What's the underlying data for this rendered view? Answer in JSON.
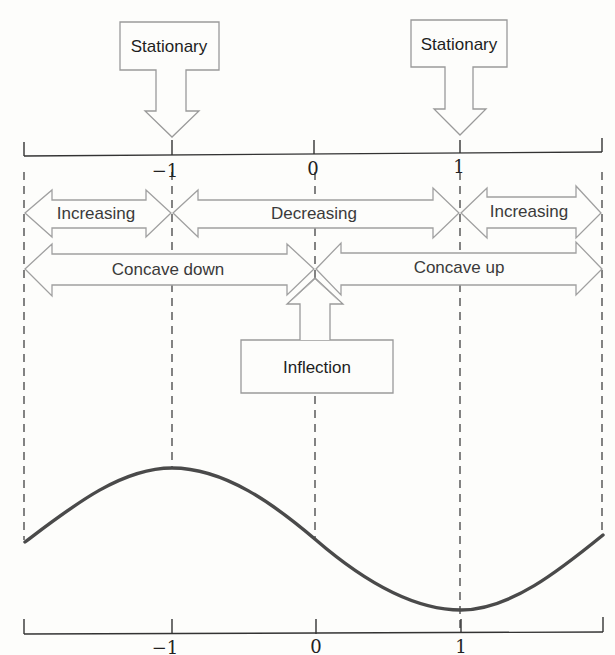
{
  "diagram": {
    "callouts": {
      "stationary_left": "Stationary",
      "stationary_right": "Stationary",
      "inflection": "Inflection"
    },
    "intervals_monotonic": [
      {
        "label": "Increasing",
        "from": "left-edge",
        "to": "-1"
      },
      {
        "label": "Decreasing",
        "from": "-1",
        "to": "1"
      },
      {
        "label": "Increasing",
        "from": "1",
        "to": "right-edge"
      }
    ],
    "intervals_concavity": [
      {
        "label": "Concave down",
        "from": "left-edge",
        "to": "0"
      },
      {
        "label": "Concave up",
        "from": "0",
        "to": "right-edge"
      }
    ],
    "top_axis": {
      "ticks": [
        "−1",
        "0",
        "1"
      ]
    },
    "bottom_axis": {
      "ticks": [
        "−1",
        "0",
        "1"
      ]
    },
    "curve": {
      "description": "cubic-like curve with local max at x=-1, inflection at x=0, local min at x=1",
      "local_max_x": -1,
      "inflection_x": 0,
      "local_min_x": 1
    },
    "colors": {
      "curve": "#4a4a4a",
      "outline": "#9a9a9a",
      "axis": "#333333",
      "background": "#fdfdfb"
    }
  }
}
